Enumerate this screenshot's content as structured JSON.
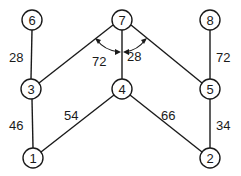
{
  "diagram": {
    "type": "weighted-graph",
    "nodes": [
      {
        "id": "1",
        "label": "1",
        "x": 33,
        "y": 158
      },
      {
        "id": "2",
        "label": "2",
        "x": 210,
        "y": 158
      },
      {
        "id": "3",
        "label": "3",
        "x": 31,
        "y": 89
      },
      {
        "id": "4",
        "label": "4",
        "x": 122,
        "y": 89
      },
      {
        "id": "5",
        "label": "5",
        "x": 210,
        "y": 89
      },
      {
        "id": "6",
        "label": "6",
        "x": 32,
        "y": 20
      },
      {
        "id": "7",
        "label": "7",
        "x": 122,
        "y": 20
      },
      {
        "id": "8",
        "label": "8",
        "x": 210,
        "y": 20
      }
    ],
    "edges": [
      {
        "from": "6",
        "to": "3",
        "weight": "28"
      },
      {
        "from": "7",
        "to": "3",
        "weight": ""
      },
      {
        "from": "7",
        "to": "4",
        "weight": ""
      },
      {
        "from": "7",
        "to": "5",
        "weight": ""
      },
      {
        "from": "8",
        "to": "5",
        "weight": "72"
      },
      {
        "from": "3",
        "to": "1",
        "weight": "46"
      },
      {
        "from": "4",
        "to": "1",
        "weight": "54"
      },
      {
        "from": "4",
        "to": "2",
        "weight": "66"
      },
      {
        "from": "5",
        "to": "2",
        "weight": "34"
      }
    ],
    "angle_labels": [
      {
        "label": "72",
        "between": [
          "7-3",
          "7-4"
        ]
      },
      {
        "label": "28",
        "between": [
          "7-4",
          "7-5"
        ]
      }
    ],
    "weight_labels": {
      "e63": "28",
      "e85": "72",
      "e31": "46",
      "e41": "54",
      "e42": "66",
      "e52": "34",
      "a734": "72",
      "a745": "28"
    }
  }
}
